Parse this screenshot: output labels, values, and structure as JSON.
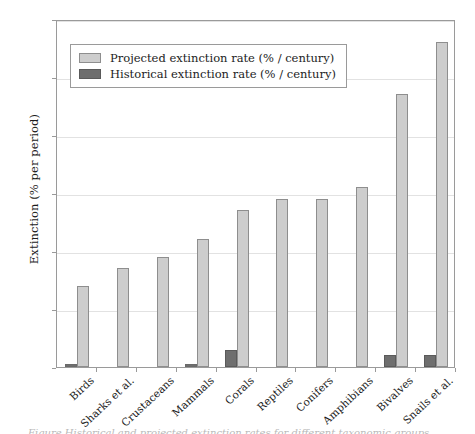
{
  "chart_data": {
    "type": "bar",
    "title": "",
    "xlabel": "",
    "ylabel": "Extinction (% per period)",
    "ylim": [
      0,
      60
    ],
    "yticks": [
      0,
      10,
      20,
      30,
      40,
      50,
      60
    ],
    "grid": true,
    "legend_position": "upper-left-inside",
    "categories": [
      "Birds",
      "Sharks et al.",
      "Crustaceans",
      "Mammals",
      "Corals",
      "Reptiles",
      "Conifers",
      "Amphibians",
      "Bivalves",
      "Snails et al."
    ],
    "series": [
      {
        "name": "Projected extinction rate (% / century)",
        "color": "#cdcdcd",
        "values": [
          14,
          17,
          19,
          22,
          27,
          29,
          29,
          31,
          47,
          56
        ]
      },
      {
        "name": "Historical extinction rate (% / century)",
        "color": "#6e6e6e",
        "values": [
          0.5,
          0,
          0,
          0.5,
          3,
          0,
          0,
          0,
          2,
          2
        ]
      }
    ]
  },
  "figure": {
    "caption_fragment": "Figure  Historical and projected extinction rates for different taxonomic groups"
  }
}
